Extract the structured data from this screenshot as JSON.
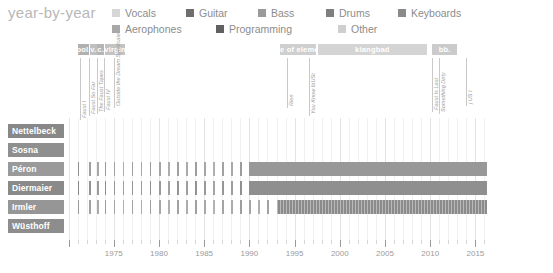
{
  "header": {
    "title": "year-by-year"
  },
  "legend": {
    "rows": [
      [
        {
          "label": "Vocals",
          "color": "#d6d6d6"
        },
        {
          "label": "Guitar",
          "color": "#6e6e6e"
        },
        {
          "label": "Bass",
          "color": "#9a9a9a"
        },
        {
          "label": "Drums",
          "color": "#7f7f7f"
        },
        {
          "label": "Keyboards",
          "color": "#8a8a8a"
        }
      ],
      [
        {
          "label": "Aerophones",
          "color": "#a8a8a8"
        },
        {
          "label": "Programming",
          "color": "#616161"
        },
        {
          "label": "Other",
          "color": "#cfcfcf"
        }
      ]
    ]
  },
  "label_bands": [
    {
      "name": "pol.",
      "start": 1971.0,
      "end": 1972.3,
      "color": "#b0b0b0"
    },
    {
      "name": "v.",
      "start": 1972.4,
      "end": 1973.1,
      "color": "#c0c0c0"
    },
    {
      "name": "c.",
      "start": 1973.2,
      "end": 1973.9,
      "color": "#b5b5b5"
    },
    {
      "name": "virgin",
      "start": 1974.0,
      "end": 1976.3,
      "color": "#c3c3c3"
    },
    {
      "name": "table of elements",
      "start": 1993.4,
      "end": 1997.4,
      "color": "#cfcfcf"
    },
    {
      "name": "klangbad",
      "start": 1997.6,
      "end": 2009.6,
      "color": "#d4d4d4"
    },
    {
      "name": "bb.",
      "start": 2010.2,
      "end": 2013.0,
      "color": "#cbcbcb"
    }
  ],
  "albums": [
    {
      "title": "Faust I",
      "year": 1971.3,
      "stem": 62
    },
    {
      "title": "Faust So Far",
      "year": 1972.3,
      "stem": 58
    },
    {
      "title": "The Faust Tapes",
      "year": 1973.2,
      "stem": 56
    },
    {
      "title": "Faust IV",
      "year": 1973.9,
      "stem": 54
    },
    {
      "title": "Outside the Dream Syndicate",
      "year": 1975.0,
      "stem": 50
    },
    {
      "title": "Rien",
      "year": 1994.2,
      "stem": 50
    },
    {
      "title": "You Know faUSt",
      "year": 1996.6,
      "stem": 58
    },
    {
      "title": "Faust Is Last",
      "year": 2010.2,
      "stem": 54
    },
    {
      "title": "Something Dirty",
      "year": 2011.0,
      "stem": 56
    },
    {
      "title": "j US t",
      "year": 2014.0,
      "stem": 48
    }
  ],
  "chart_data": {
    "type": "bar",
    "title": "year-by-year",
    "xlabel": "",
    "ylabel": "",
    "xlim": [
      1969.5,
      2016.5
    ],
    "grid": true,
    "legend_position": "top",
    "x_ticks": [
      1975,
      1980,
      1985,
      1990,
      1995,
      2000,
      2005,
      2010,
      2015
    ],
    "x_tick_labels": [
      "1975",
      "1980",
      "1985",
      "1990",
      "1995",
      "2000",
      "2005",
      "2010",
      "2015"
    ],
    "minor_tick_step": 1,
    "categories": [
      "Nettelbeck",
      "Sosna",
      "Péron",
      "Diermaier",
      "Irmler",
      "Wüsthoff"
    ],
    "series": [
      {
        "name": "Nettelbeck",
        "label_color": "#888888",
        "segments": [],
        "ticks": []
      },
      {
        "name": "Sosna",
        "label_color": "#8f8f8f",
        "segments": [],
        "ticks": []
      },
      {
        "name": "Péron",
        "label_color": "#9a9a9a",
        "segments": [
          {
            "start": 1990.0,
            "end": 2016.3,
            "color": "#989898"
          }
        ],
        "ticks": [
          {
            "year": 1971.0,
            "color": "#8f8f8f"
          },
          {
            "year": 1972.3,
            "color": "#9f9f9f"
          },
          {
            "year": 1973.2,
            "color": "#a7a7a7"
          },
          {
            "year": 1974.0,
            "color": "#9a9a9a"
          },
          {
            "year": 1975.0,
            "color": "#a2a2a2"
          },
          {
            "year": 1976.0,
            "color": "#adadad"
          },
          {
            "year": 1977.0,
            "color": "#a0a0a0"
          },
          {
            "year": 1978.0,
            "color": "#a8a8a8"
          },
          {
            "year": 1979.0,
            "color": "#9d9d9d"
          },
          {
            "year": 1980.0,
            "color": "#a5a5a5"
          },
          {
            "year": 1981.0,
            "color": "#adadad"
          },
          {
            "year": 1982.0,
            "color": "#a0a0a0"
          },
          {
            "year": 1983.0,
            "color": "#aaaaaa"
          },
          {
            "year": 1984.0,
            "color": "#9e9e9e"
          },
          {
            "year": 1985.0,
            "color": "#a6a6a6"
          },
          {
            "year": 1986.0,
            "color": "#b0b0b0"
          },
          {
            "year": 1987.0,
            "color": "#a2a2a2"
          },
          {
            "year": 1988.0,
            "color": "#a9a9a9"
          },
          {
            "year": 1989.0,
            "color": "#9c9c9c"
          }
        ]
      },
      {
        "name": "Diermaier",
        "label_color": "#8a8a8a",
        "segments": [
          {
            "start": 1990.0,
            "end": 2016.3,
            "color": "#8f8f8f"
          }
        ],
        "ticks": [
          {
            "year": 1971.0,
            "color": "#888888"
          },
          {
            "year": 1972.3,
            "color": "#929292"
          },
          {
            "year": 1973.2,
            "color": "#9b9b9b"
          },
          {
            "year": 1974.0,
            "color": "#8e8e8e"
          },
          {
            "year": 1975.0,
            "color": "#979797"
          },
          {
            "year": 1976.0,
            "color": "#a1a1a1"
          },
          {
            "year": 1977.0,
            "color": "#949494"
          },
          {
            "year": 1978.0,
            "color": "#9c9c9c"
          },
          {
            "year": 1979.0,
            "color": "#919191"
          },
          {
            "year": 1980.0,
            "color": "#999999"
          },
          {
            "year": 1981.0,
            "color": "#a2a2a2"
          },
          {
            "year": 1982.0,
            "color": "#949494"
          },
          {
            "year": 1983.0,
            "color": "#9e9e9e"
          },
          {
            "year": 1984.0,
            "color": "#929292"
          },
          {
            "year": 1985.0,
            "color": "#9a9a9a"
          },
          {
            "year": 1986.0,
            "color": "#a4a4a4"
          },
          {
            "year": 1987.0,
            "color": "#969696"
          },
          {
            "year": 1988.0,
            "color": "#9d9d9d"
          },
          {
            "year": 1989.0,
            "color": "#909090"
          }
        ]
      },
      {
        "name": "Irmler",
        "label_color": "#969696",
        "segments": [
          {
            "start": 1993.1,
            "end": 2016.3,
            "color": "#8b8b8b",
            "hatch": true
          }
        ],
        "ticks": [
          {
            "year": 1971.0,
            "color": "#9a9a9a"
          },
          {
            "year": 1972.3,
            "color": "#a2a2a2"
          },
          {
            "year": 1973.2,
            "color": "#aaaaaa"
          },
          {
            "year": 1974.0,
            "color": "#9d9d9d"
          },
          {
            "year": 1975.0,
            "color": "#a5a5a5"
          },
          {
            "year": 1976.0,
            "color": "#b0b0b0"
          },
          {
            "year": 1977.0,
            "color": "#a3a3a3"
          },
          {
            "year": 1978.0,
            "color": "#ababab"
          },
          {
            "year": 1979.0,
            "color": "#9f9f9f"
          },
          {
            "year": 1980.0,
            "color": "#a7a7a7"
          },
          {
            "year": 1981.0,
            "color": "#b0b0b0"
          },
          {
            "year": 1982.0,
            "color": "#a2a2a2"
          },
          {
            "year": 1983.0,
            "color": "#acacac"
          },
          {
            "year": 1984.0,
            "color": "#a0a0a0"
          },
          {
            "year": 1985.0,
            "color": "#a8a8a8"
          },
          {
            "year": 1986.0,
            "color": "#b2b2b2"
          },
          {
            "year": 1987.0,
            "color": "#a4a4a4"
          },
          {
            "year": 1988.0,
            "color": "#ababab"
          },
          {
            "year": 1989.0,
            "color": "#9e9e9e"
          },
          {
            "year": 1990.0,
            "color": "#a6a6a6"
          },
          {
            "year": 1991.0,
            "color": "#b0b0b0"
          },
          {
            "year": 1992.0,
            "color": "#a2a2a2"
          }
        ]
      },
      {
        "name": "Wüsthoff",
        "label_color": "#8d8d8d",
        "segments": [],
        "ticks": []
      }
    ]
  }
}
